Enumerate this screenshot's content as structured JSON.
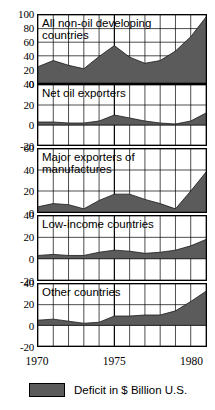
{
  "chart_data": {
    "type": "area",
    "title": "",
    "xlabel": "",
    "ylabel": "Deficit in $ Billion U.S.",
    "xlim": [
      1970,
      1981
    ],
    "xticks": [
      1970,
      1975,
      1980
    ],
    "xtick_labels": [
      "1970",
      "1975",
      "1980"
    ],
    "grid": true,
    "legend_position": "bottom-left",
    "legend": [
      {
        "label": "Deficit in $ Billion U.S.",
        "color": "#5b5b5b"
      }
    ],
    "series_fill_color": "#5b5b5b",
    "x": [
      1970,
      1971,
      1972,
      1973,
      1974,
      1975,
      1976,
      1977,
      1978,
      1979,
      1980,
      1981
    ],
    "panels": [
      {
        "name": "all-non-oil-developing-countries",
        "title": "All non-oil developing\ncountries",
        "ylim": [
          0,
          100
        ],
        "yticks": [
          0,
          20,
          40,
          60,
          80,
          100
        ],
        "ytick_labels": [
          "0",
          "20",
          "40",
          "60",
          "80",
          "100"
        ],
        "values": [
          24,
          33,
          26,
          21,
          39,
          55,
          38,
          29,
          33,
          47,
          68,
          97
        ]
      },
      {
        "name": "net-oil-exporters",
        "title": "Net oil exporters",
        "ylim": [
          -20,
          40
        ],
        "yticks": [
          -20,
          0,
          20,
          40
        ],
        "ytick_labels": [
          "-20",
          "0",
          "20",
          "40"
        ],
        "values": [
          3,
          3,
          2,
          2,
          4,
          10,
          7,
          4,
          2,
          1,
          4,
          12
        ]
      },
      {
        "name": "major-exporters-of-manufactures",
        "title": "Major exporters of\nmanufactures",
        "ylim": [
          0,
          60
        ],
        "yticks": [
          0,
          20,
          40,
          60
        ],
        "ytick_labels": [
          "0",
          "20",
          "40",
          "60"
        ],
        "values": [
          5,
          8,
          7,
          3,
          11,
          17,
          17,
          12,
          8,
          3,
          20,
          38
        ]
      },
      {
        "name": "low-income-countries",
        "title": "Low-income countries",
        "ylim": [
          -20,
          40
        ],
        "yticks": [
          -20,
          0,
          20,
          40
        ],
        "ytick_labels": [
          "-20",
          "0",
          "20",
          "40"
        ],
        "values": [
          3,
          4,
          3,
          3,
          6,
          8,
          7,
          5,
          6,
          8,
          12,
          18
        ]
      },
      {
        "name": "other-countries",
        "title": "Other countries",
        "ylim": [
          -20,
          40
        ],
        "yticks": [
          -20,
          0,
          20,
          40
        ],
        "ytick_labels": [
          "-20",
          "0",
          "20",
          "40"
        ],
        "values": [
          5,
          6,
          4,
          2,
          3,
          9,
          9,
          10,
          10,
          14,
          23,
          33
        ]
      }
    ]
  }
}
